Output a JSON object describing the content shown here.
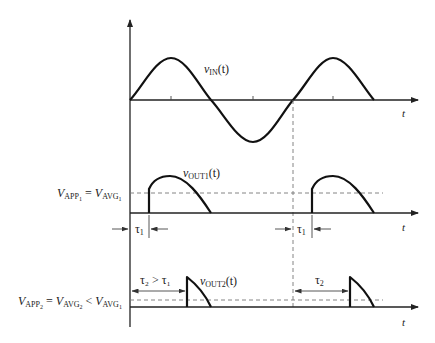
{
  "figure": {
    "panels": [
      {
        "id": "input",
        "signal_label": "v",
        "signal_sub": "IN",
        "signal_arg": "(t)",
        "axis_label": "t"
      },
      {
        "id": "output1",
        "signal_label": "v",
        "signal_sub": "OUT1",
        "signal_arg": "(t)",
        "axis_label": "t",
        "level_label": {
          "lhs": "V",
          "lhs_sub": "APP",
          "lhs_subsub": "1",
          "eq": " = ",
          "rhs": "V",
          "rhs_sub": "AVG",
          "rhs_subsub": "1"
        },
        "delay_label": "τ",
        "delay_sub": "1"
      },
      {
        "id": "output2",
        "signal_label": "v",
        "signal_sub": "OUT2",
        "signal_arg": "(t)",
        "axis_label": "t",
        "level_label": {
          "lhs": "V",
          "lhs_sub": "APP",
          "lhs_subsub": "2",
          "eq": " = ",
          "mid": "V",
          "mid_sub": "AVG",
          "mid_subsub": "2",
          "lt": " < ",
          "rhs": "V",
          "rhs_sub": "AVG",
          "rhs_subsub": "1"
        },
        "delay_label_first": "τ₂ > τ₁",
        "delay_label_second": "τ",
        "delay_sub": "2"
      }
    ],
    "colors": {
      "ink": "#111111",
      "dashed": "#777777",
      "background": "#ffffff"
    }
  }
}
